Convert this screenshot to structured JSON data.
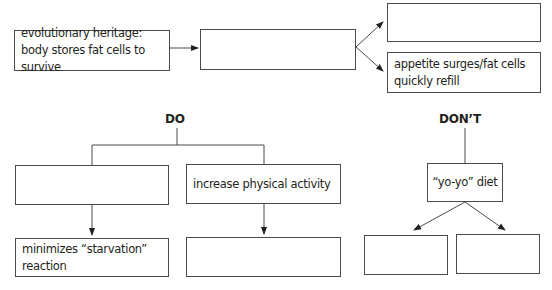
{
  "diagram": {
    "top_row": {
      "cause_box": "evolutionary heritage: body stores fat cells to survive",
      "middle_box": "",
      "effect_top_box": "",
      "effect_bottom_box": "appetite surges/fat cells quickly refill"
    },
    "do_section": {
      "heading": "DO",
      "left_branch": {
        "action_box": "",
        "result_box": "minimizes “starvation” reaction"
      },
      "right_branch": {
        "action_box": "increase physical activity",
        "result_box": ""
      }
    },
    "dont_section": {
      "heading": "DON’T",
      "action_box": "“yo-yo” diet",
      "result_left_box": "",
      "result_right_box": ""
    },
    "colors": {
      "line": "#4a4a4a",
      "text": "#231f20",
      "background": "#ffffff"
    }
  }
}
